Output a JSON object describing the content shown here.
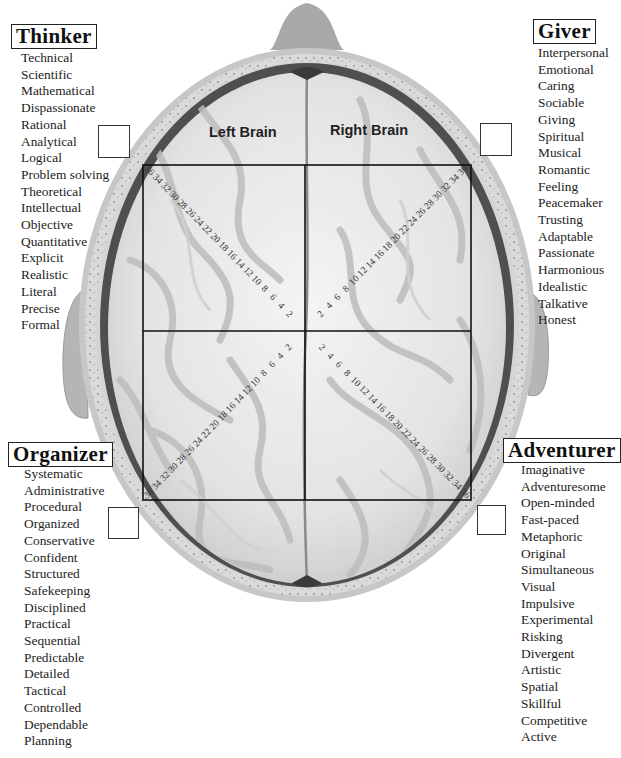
{
  "diagram": {
    "hemispheres": {
      "left_label": "Left Brain",
      "right_label": "Right Brain"
    },
    "grid": {
      "left": 143,
      "top": 165,
      "right": 471,
      "bottom": 500,
      "center_x": 305,
      "center_y": 331,
      "line_color": "#111111"
    },
    "scale": {
      "values": [
        "2",
        "4",
        "6",
        "8",
        "10",
        "12",
        "14",
        "16",
        "18",
        "20",
        "22",
        "24",
        "26",
        "28",
        "30",
        "32",
        "34",
        "36"
      ],
      "max": 36
    },
    "colors": {
      "skull_outer": "#c9c9c9",
      "skull_bone": "#dcdcdc",
      "skull_dark_ring": "#555555",
      "brain_fill": "#e9e9e9",
      "brain_fold": "#bdbdbd",
      "ear": "#b8b8b8"
    }
  },
  "categories": {
    "thinker": {
      "title": "Thinker",
      "traits": [
        "Technical",
        "Scientific",
        "Mathematical",
        "Dispassionate",
        "Rational",
        "Analytical",
        "Logical",
        "Problem solving",
        "Theoretical",
        "Intellectual",
        "Objective",
        "Quantitative",
        "Explicit",
        "Realistic",
        "Literal",
        "Precise",
        "Formal"
      ]
    },
    "giver": {
      "title": "Giver",
      "traits": [
        "Interpersonal",
        "Emotional",
        "Caring",
        "Sociable",
        "Giving",
        "Spiritual",
        "Musical",
        "Romantic",
        "Feeling",
        "Peacemaker",
        "Trusting",
        "Adaptable",
        "Passionate",
        "Harmonious",
        "Idealistic",
        "Talkative",
        "Honest"
      ]
    },
    "organizer": {
      "title": "Organizer",
      "traits": [
        "Systematic",
        "Administrative",
        "Procedural",
        "Organized",
        "Conservative",
        "Confident",
        "Structured",
        "Safekeeping",
        "Disciplined",
        "Practical",
        "Sequential",
        "Predictable",
        "Detailed",
        "Tactical",
        "Controlled",
        "Dependable",
        "Planning"
      ]
    },
    "adventurer": {
      "title": "Adventurer",
      "traits": [
        "Imaginative",
        "Adventuresome",
        "Open-minded",
        "Fast-paced",
        "Metaphoric",
        "Original",
        "Simultaneous",
        "Visual",
        "Impulsive",
        "Experimental",
        "Risking",
        "Divergent",
        "Artistic",
        "Spatial",
        "Skillful",
        "Competitive",
        "Active"
      ]
    }
  }
}
